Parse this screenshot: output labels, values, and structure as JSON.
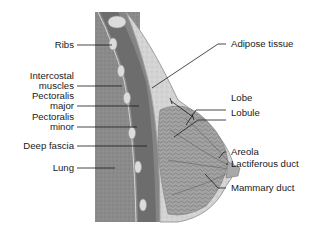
{
  "diagram": {
    "type": "anatomical-cross-section",
    "left_labels": [
      {
        "id": "ribs",
        "text": "Ribs"
      },
      {
        "id": "intercostal",
        "line1": "Intercostal",
        "line2": "muscles"
      },
      {
        "id": "pec-major",
        "line1": "Pectoralis",
        "line2": "major"
      },
      {
        "id": "pec-minor",
        "line1": "Pectoralis",
        "line2": "minor"
      },
      {
        "id": "deep-fascia",
        "text": "Deep fascia"
      },
      {
        "id": "lung",
        "text": "Lung"
      }
    ],
    "right_labels": [
      {
        "id": "adipose",
        "text": "Adipose tissue"
      },
      {
        "id": "lobe",
        "text": "Lobe"
      },
      {
        "id": "lobule",
        "text": "Lobule"
      },
      {
        "id": "areola",
        "text": "Areola"
      },
      {
        "id": "lactiferous",
        "text": "Lactiferous duct"
      },
      {
        "id": "mammary",
        "text": "Mammary duct"
      }
    ],
    "colors": {
      "lung": "#8a8a8a",
      "muscle": "#6f6f6f",
      "rib": "#d8d8d8",
      "adipose": "#d2d2d2",
      "gland": "#9a9a9a",
      "skin": "#b5b5b5",
      "line": "#1a1a1a"
    }
  }
}
